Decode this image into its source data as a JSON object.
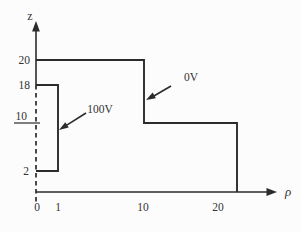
{
  "diagram": {
    "axes": {
      "vertical": {
        "label": "z",
        "ticks": [
          "20",
          "18",
          "10",
          "2"
        ]
      },
      "horizontal": {
        "label": "ρ",
        "ticks": [
          "0",
          "1",
          "10",
          "20"
        ]
      }
    },
    "annotations": {
      "outer_conductor": {
        "label": "0V"
      },
      "inner_conductor": {
        "label": "100V"
      }
    },
    "geometry": {
      "inner_conductor": {
        "voltage": "100V",
        "rho_range": [
          0,
          1
        ],
        "z_range": [
          2,
          18
        ]
      },
      "outer_conductor": {
        "voltage": "0V",
        "boundary_path_rho_z": [
          [
            0,
            20
          ],
          [
            10,
            20
          ],
          [
            10,
            10
          ],
          [
            20,
            10
          ],
          [
            20,
            0
          ]
        ]
      }
    },
    "colors": {
      "line": "#2b2b2b",
      "text": "#333333",
      "background": "#fcfcfc"
    }
  }
}
